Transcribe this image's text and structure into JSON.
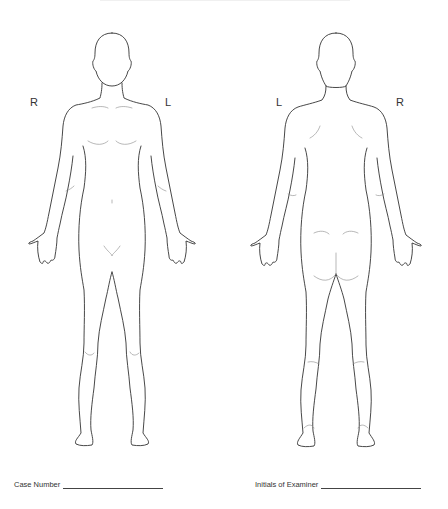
{
  "document": {
    "type": "body diagram form",
    "front_view": {
      "left_label": "R",
      "right_label": "L"
    },
    "back_view": {
      "left_label": "L",
      "right_label": "R"
    },
    "fields": [
      {
        "label": "Case Number",
        "value": ""
      },
      {
        "label": "Initials of Examiner",
        "value": ""
      }
    ]
  },
  "colors": {
    "outline": "#333333",
    "detail": "#777777",
    "background": "#ffffff"
  }
}
